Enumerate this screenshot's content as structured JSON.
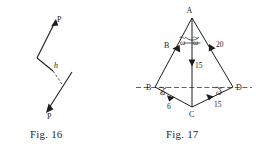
{
  "page": {
    "background": "#ffffff",
    "ink": "#1d1d1d"
  },
  "figures": [
    {
      "id": "fig16",
      "caption": "Fig. 16",
      "description": "couple-diagram",
      "labels": {
        "force_upper": "P",
        "force_lower": "P",
        "distance": "h"
      }
    },
    {
      "id": "fig17",
      "caption": "Fig. 17",
      "description": "force-polygon-quadrilateral",
      "vertices": {
        "a": "A",
        "b": "B",
        "c": "C",
        "d": "D"
      },
      "magnitudes": {
        "ad": "20",
        "ac": "15",
        "dc": "15",
        "bc": "6"
      },
      "angles": {
        "apex_left": "ω",
        "apex_right": "ω",
        "base_left": "ω",
        "base_right": "ω"
      }
    }
  ]
}
